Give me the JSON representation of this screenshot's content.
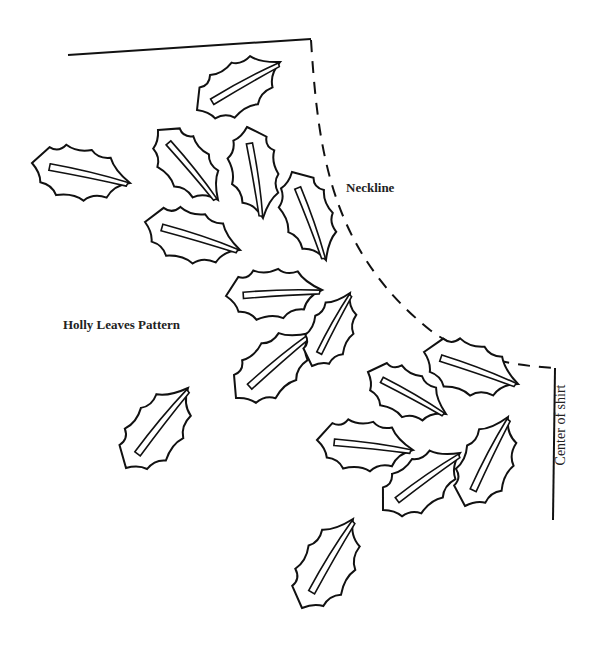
{
  "labels": {
    "neckline": "Neckline",
    "title": "Holly Leaves Pattern",
    "center": "Center of shirt"
  },
  "colors": {
    "ink": "#111111",
    "background": "#ffffff"
  },
  "guides": {
    "shoulder_line": [
      [
        68,
        55
      ],
      [
        311,
        39
      ]
    ],
    "neckline_curve": "M311,40 C318,150 330,250 430,330 C470,360 520,366 555,368",
    "center_line": [
      [
        555,
        368
      ],
      [
        553,
        520
      ]
    ]
  },
  "leaves": [
    {
      "base": [
        32,
        163
      ],
      "tip": [
        130,
        183
      ]
    },
    {
      "base": [
        197,
        110
      ],
      "tip": [
        280,
        62
      ]
    },
    {
      "base": [
        158,
        130
      ],
      "tip": [
        218,
        200
      ]
    },
    {
      "base": [
        247,
        127
      ],
      "tip": [
        263,
        218
      ]
    },
    {
      "base": [
        292,
        172
      ],
      "tip": [
        326,
        260
      ]
    },
    {
      "base": [
        145,
        222
      ],
      "tip": [
        240,
        250
      ]
    },
    {
      "base": [
        226,
        296
      ],
      "tip": [
        322,
        290
      ]
    },
    {
      "base": [
        236,
        398
      ],
      "tip": [
        310,
        333
      ]
    },
    {
      "base": [
        312,
        366
      ],
      "tip": [
        350,
        293
      ]
    },
    {
      "base": [
        126,
        468
      ],
      "tip": [
        188,
        388
      ]
    },
    {
      "base": [
        368,
        372
      ],
      "tip": [
        446,
        414
      ]
    },
    {
      "base": [
        424,
        352
      ],
      "tip": [
        518,
        384
      ]
    },
    {
      "base": [
        317,
        440
      ],
      "tip": [
        413,
        450
      ]
    },
    {
      "base": [
        383,
        510
      ],
      "tip": [
        460,
        453
      ]
    },
    {
      "base": [
        465,
        506
      ],
      "tip": [
        508,
        417
      ]
    },
    {
      "base": [
        302,
        608
      ],
      "tip": [
        353,
        519
      ]
    }
  ]
}
